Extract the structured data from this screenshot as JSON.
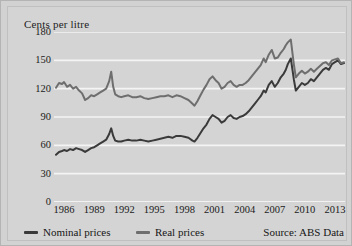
{
  "chart_data": {
    "type": "line",
    "title": "",
    "subtitle": "",
    "ylabel": "Cents per litre",
    "xlabel": "",
    "ylim": [
      0,
      180
    ],
    "xlim": [
      1985,
      2014
    ],
    "yticks": [
      180,
      150,
      120,
      90,
      60,
      30,
      0
    ],
    "xticks": [
      1986,
      1989,
      1992,
      1995,
      1998,
      2001,
      2004,
      2007,
      2010,
      2013
    ],
    "grid": "horizontal",
    "legend_position": "below-left",
    "source_note": "Source: ABS Data",
    "series": [
      {
        "name": "Nominal prices",
        "color": "#3a3a3a",
        "x": [
          1985.2,
          1985.5,
          1985.8,
          1986.0,
          1986.3,
          1986.6,
          1986.9,
          1987.2,
          1987.5,
          1987.8,
          1988.1,
          1988.4,
          1988.7,
          1989.0,
          1989.3,
          1989.6,
          1989.9,
          1990.2,
          1990.5,
          1990.7,
          1990.9,
          1991.1,
          1991.4,
          1991.7,
          1992.0,
          1992.4,
          1992.8,
          1993.2,
          1993.6,
          1994.0,
          1994.4,
          1994.8,
          1995.2,
          1995.6,
          1996.0,
          1996.4,
          1996.8,
          1997.2,
          1997.6,
          1998.0,
          1998.4,
          1998.8,
          1999.0,
          1999.3,
          1999.6,
          1999.9,
          2000.2,
          2000.5,
          2000.8,
          2001.1,
          2001.4,
          2001.7,
          2002.0,
          2002.3,
          2002.6,
          2002.9,
          2003.2,
          2003.5,
          2003.8,
          2004.1,
          2004.4,
          2004.7,
          2005.0,
          2005.3,
          2005.6,
          2005.9,
          2006.1,
          2006.4,
          2006.7,
          2007.0,
          2007.3,
          2007.6,
          2007.9,
          2008.1,
          2008.3,
          2008.6,
          2008.9,
          2009.1,
          2009.4,
          2009.7,
          2010.0,
          2010.3,
          2010.6,
          2010.9,
          2011.2,
          2011.5,
          2011.8,
          2012.1,
          2012.4,
          2012.7,
          2013.0,
          2013.3,
          2013.6,
          2013.9
        ],
        "values": [
          50,
          53,
          54,
          55,
          54,
          56,
          55,
          57,
          56,
          55,
          53,
          55,
          57,
          58,
          60,
          62,
          64,
          66,
          72,
          78,
          70,
          65,
          64,
          64,
          65,
          66,
          65,
          65,
          66,
          65,
          64,
          65,
          66,
          67,
          68,
          69,
          68,
          70,
          70,
          69,
          68,
          65,
          64,
          68,
          73,
          78,
          82,
          88,
          92,
          90,
          88,
          84,
          86,
          90,
          92,
          89,
          88,
          90,
          91,
          93,
          96,
          100,
          104,
          108,
          112,
          118,
          116,
          124,
          128,
          122,
          126,
          132,
          136,
          140,
          146,
          152,
          130,
          118,
          122,
          126,
          124,
          126,
          130,
          128,
          132,
          136,
          140,
          142,
          140,
          146,
          148,
          150,
          146,
          147
        ]
      },
      {
        "name": "Real prices",
        "color": "#6e6e6e",
        "x": [
          1985.2,
          1985.5,
          1985.8,
          1986.0,
          1986.3,
          1986.6,
          1986.9,
          1987.2,
          1987.5,
          1987.8,
          1988.1,
          1988.4,
          1988.7,
          1989.0,
          1989.3,
          1989.6,
          1989.9,
          1990.2,
          1990.5,
          1990.7,
          1990.9,
          1991.1,
          1991.4,
          1991.7,
          1992.0,
          1992.4,
          1992.8,
          1993.2,
          1993.6,
          1994.0,
          1994.4,
          1994.8,
          1995.2,
          1995.6,
          1996.0,
          1996.4,
          1996.8,
          1997.2,
          1997.6,
          1998.0,
          1998.4,
          1998.8,
          1999.0,
          1999.3,
          1999.6,
          1999.9,
          2000.2,
          2000.5,
          2000.8,
          2001.1,
          2001.4,
          2001.7,
          2002.0,
          2002.3,
          2002.6,
          2002.9,
          2003.2,
          2003.5,
          2003.8,
          2004.1,
          2004.4,
          2004.7,
          2005.0,
          2005.3,
          2005.6,
          2005.9,
          2006.1,
          2006.4,
          2006.7,
          2007.0,
          2007.3,
          2007.6,
          2007.9,
          2008.1,
          2008.3,
          2008.6,
          2008.9,
          2009.1,
          2009.4,
          2009.7,
          2010.0,
          2010.3,
          2010.6,
          2010.9,
          2011.2,
          2011.5,
          2011.8,
          2012.1,
          2012.4,
          2012.7,
          2013.0,
          2013.3,
          2013.6,
          2013.9
        ],
        "values": [
          121,
          126,
          125,
          127,
          122,
          124,
          120,
          122,
          118,
          115,
          108,
          110,
          113,
          112,
          114,
          116,
          118,
          120,
          128,
          138,
          122,
          114,
          112,
          111,
          112,
          113,
          111,
          111,
          112,
          110,
          109,
          110,
          111,
          112,
          112,
          113,
          111,
          113,
          112,
          110,
          108,
          104,
          102,
          107,
          113,
          119,
          124,
          130,
          133,
          129,
          126,
          120,
          122,
          126,
          128,
          124,
          122,
          124,
          124,
          126,
          129,
          133,
          137,
          141,
          145,
          152,
          148,
          156,
          161,
          152,
          153,
          158,
          162,
          166,
          169,
          172,
          146,
          132,
          136,
          139,
          136,
          138,
          141,
          138,
          141,
          144,
          147,
          148,
          145,
          150,
          151,
          152,
          147,
          148
        ]
      }
    ]
  },
  "legend": {
    "items": [
      {
        "label": "Nominal prices",
        "color": "#3a3a3a"
      },
      {
        "label": "Real prices",
        "color": "#6e6e6e"
      }
    ]
  },
  "source": "Source: ABS Data"
}
